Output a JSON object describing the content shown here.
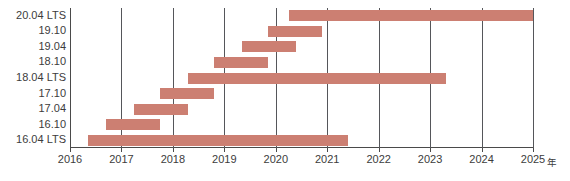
{
  "chart_data": {
    "type": "bar",
    "orientation": "horizontal",
    "subtype": "gantt",
    "title": "",
    "subtitle": "",
    "xlabel": "年",
    "ylabel": "",
    "xlim": [
      2016,
      2025
    ],
    "xticks": [
      2016,
      2017,
      2018,
      2019,
      2020,
      2021,
      2022,
      2023,
      2024,
      2025
    ],
    "xtick_labels": [
      "2016",
      "2017",
      "2018",
      "2019",
      "2020",
      "2021",
      "2022",
      "2023",
      "2024",
      "2025"
    ],
    "x_axis_suffix": "年",
    "grid": true,
    "grid_axis": "x",
    "legend": false,
    "bar_color": "#cc7f72",
    "axis_color": "#4a4a4a",
    "grid_color": "#55565a",
    "text_color": "#3c3c3c",
    "categories": [
      "20.04 LTS",
      "19.10",
      "19.04",
      "18.10",
      "18.04 LTS",
      "17.10",
      "17.04",
      "16.10",
      "16.04 LTS"
    ],
    "bars": [
      {
        "label": "20.04 LTS",
        "start": 2020.25,
        "end": 2025.0
      },
      {
        "label": "19.10",
        "start": 2019.85,
        "end": 2020.9
      },
      {
        "label": "19.04",
        "start": 2019.35,
        "end": 2020.4
      },
      {
        "label": "18.10",
        "start": 2018.8,
        "end": 2019.85
      },
      {
        "label": "18.04 LTS",
        "start": 2018.3,
        "end": 2023.3
      },
      {
        "label": "17.10",
        "start": 2017.75,
        "end": 2018.8
      },
      {
        "label": "17.04",
        "start": 2017.25,
        "end": 2018.3
      },
      {
        "label": "16.10",
        "start": 2016.7,
        "end": 2017.75
      },
      {
        "label": "16.04 LTS",
        "start": 2016.35,
        "end": 2021.4
      }
    ]
  }
}
